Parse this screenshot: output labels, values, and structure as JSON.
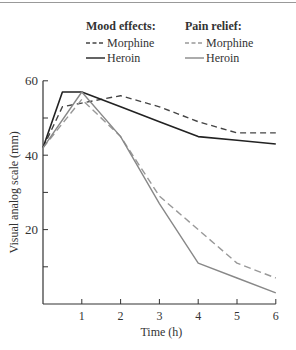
{
  "chart_data": {
    "type": "line",
    "title": "",
    "xlabel": "Time (h)",
    "ylabel": "Visual analog scale (mm)",
    "xlim": [
      0,
      6
    ],
    "ylim": [
      0,
      60
    ],
    "x_ticks": [
      "1",
      "2",
      "3",
      "4",
      "5",
      "6"
    ],
    "y_ticks": [
      "20",
      "40",
      "60"
    ],
    "grid": false,
    "legend": {
      "position": "top",
      "groups": [
        {
          "title": "Mood effects:",
          "entries": [
            "Morphine",
            "Heroin"
          ]
        },
        {
          "title": "Pain relief:",
          "entries": [
            "Morphine",
            "Heroin"
          ]
        }
      ]
    },
    "series": [
      {
        "name": "Mood effects: Morphine",
        "style": "dashed",
        "color": "#444444",
        "x": [
          0,
          0.5,
          1,
          2,
          3,
          4,
          5,
          6
        ],
        "values": [
          42,
          53,
          54,
          56,
          53,
          49,
          46,
          46
        ]
      },
      {
        "name": "Mood effects: Heroin",
        "style": "solid",
        "color": "#222222",
        "x": [
          0,
          0.5,
          1,
          2,
          3,
          4,
          5,
          6
        ],
        "values": [
          42,
          57,
          57,
          53,
          49,
          45,
          44,
          43
        ]
      },
      {
        "name": "Pain relief: Morphine",
        "style": "dashed",
        "color": "#999999",
        "x": [
          0,
          1,
          2,
          3,
          4,
          5,
          6
        ],
        "values": [
          42,
          55,
          45,
          29,
          20,
          11,
          7
        ]
      },
      {
        "name": "Pain relief: Heroin",
        "style": "solid",
        "color": "#888888",
        "x": [
          0,
          1,
          2,
          3,
          4,
          5,
          6
        ],
        "values": [
          42,
          57,
          45,
          27,
          11,
          7,
          3
        ]
      }
    ]
  }
}
